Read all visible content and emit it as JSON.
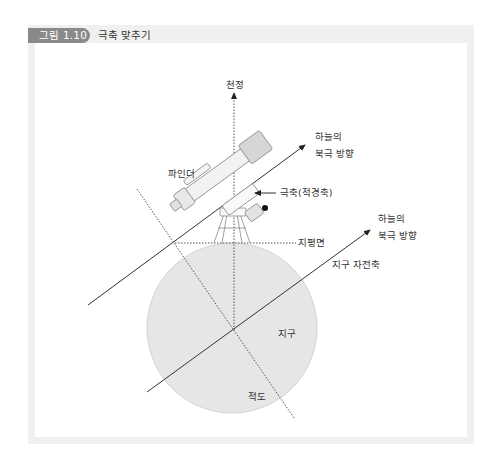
{
  "figure": {
    "number": "그림 1.10",
    "title": "극축 맞추기"
  },
  "labels": {
    "zenith": "천정",
    "finder": "파인더",
    "polar_axis": "극축(적경축)",
    "celestial_pole_upper_line1": "하늘의",
    "celestial_pole_upper_line2": "북극 방향",
    "celestial_pole_lower_line1": "하늘의",
    "celestial_pole_lower_line2": "북극 방향",
    "horizon": "지평면",
    "earth_axis": "지구 자전축",
    "earth": "지구",
    "equator": "적도"
  },
  "colors": {
    "frame": "#f0f0f0",
    "caption_pill": "#8a8a8a",
    "earth_fill": "#e6e6e6",
    "line": "#333333",
    "dotted": "#555555"
  }
}
